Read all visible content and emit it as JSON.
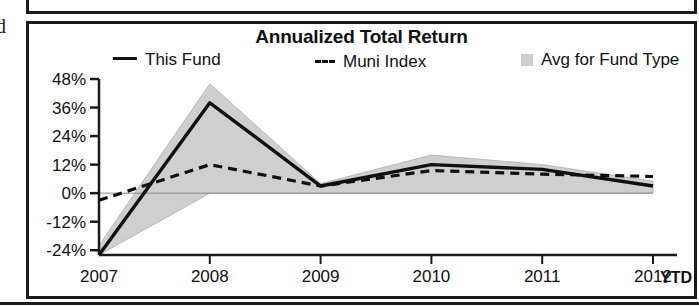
{
  "page": {
    "left_bleed_text": "d"
  },
  "chart_panel": {
    "title": "Annualized Total Return",
    "legend": [
      {
        "key": "this-fund",
        "label": "This Fund",
        "marker": "solid-line-swatch",
        "color": "#101010"
      },
      {
        "key": "muni-index",
        "label": "Muni Index",
        "marker": "dashed-line-swatch",
        "color": "#101010"
      },
      {
        "key": "avg-type",
        "label": "Avg for Fund Type",
        "marker": "filled-box-swatch",
        "color": "#cfcfcf"
      }
    ],
    "ytd_label": "YTD"
  },
  "chart_data": {
    "type": "line",
    "title": "Annualized Total Return",
    "xlabel": "",
    "ylabel": "",
    "x": [
      "2007",
      "2008",
      "2009",
      "2010",
      "2011",
      "2012"
    ],
    "xtick_labels": [
      "2007",
      "2008",
      "2009",
      "2010",
      "2011",
      "2012"
    ],
    "ytick_labels": [
      "48%",
      "36%",
      "24%",
      "12%",
      "0%",
      "-12%",
      "-24%"
    ],
    "ytick_values": [
      48,
      36,
      24,
      12,
      0,
      -12,
      -24
    ],
    "ylim": [
      -26,
      48
    ],
    "grid": false,
    "legend_position": "top",
    "series": [
      {
        "name": "This Fund",
        "style": "solid",
        "color": "#101010",
        "values": [
          -26,
          38,
          3,
          12,
          10,
          3
        ]
      },
      {
        "name": "Muni Index",
        "style": "dashed",
        "color": "#101010",
        "values": [
          -3,
          12,
          3,
          9.5,
          8,
          7
        ]
      },
      {
        "name": "Avg for Fund Type",
        "style": "band",
        "color": "#cfcfcf",
        "upper": [
          -22,
          46,
          4,
          16,
          12,
          5
        ],
        "lower": [
          -26,
          0,
          0,
          0,
          0,
          0
        ]
      }
    ],
    "annotations": [
      "YTD"
    ]
  }
}
